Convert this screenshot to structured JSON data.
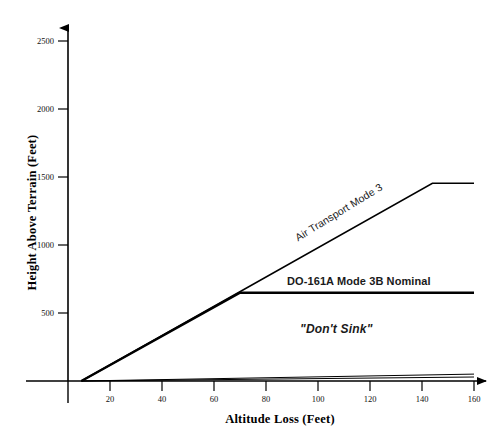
{
  "chart_data": {
    "type": "line",
    "title": "",
    "xlabel": "Altitude Loss (Feet)",
    "ylabel": "Height Above Terrain (Feet)",
    "xlim": [
      0,
      163
    ],
    "ylim": [
      0,
      2620
    ],
    "xticks": [
      20,
      40,
      60,
      80,
      100,
      120,
      140,
      160
    ],
    "yticks": [
      500,
      1000,
      1500,
      2000,
      2500
    ],
    "xtick_labels": [
      "20",
      "40",
      "60",
      "80",
      "100",
      "120",
      "140",
      "160"
    ],
    "ytick_labels": [
      "500",
      "1000",
      "1500",
      "2000",
      "2500"
    ],
    "grid": false,
    "legend": "inline-annotations",
    "series": [
      {
        "name": "Air Transport Mode 3",
        "style": "solid",
        "linewidth": 1.6,
        "color": "#000000",
        "points": [
          [
            9,
            0
          ],
          [
            144,
            1480
          ],
          [
            160,
            1480
          ]
        ]
      },
      {
        "name": "DO-161A Mode 3B Nominal",
        "style": "solid",
        "linewidth": 2.4,
        "color": "#000000",
        "points": [
          [
            9,
            0
          ],
          [
            70,
            660
          ],
          [
            160,
            660
          ]
        ]
      },
      {
        "name": "lower-envelope-upper",
        "style": "solid",
        "linewidth": 1.0,
        "color": "#000000",
        "points": [
          [
            9,
            0
          ],
          [
            160,
            52
          ]
        ]
      },
      {
        "name": "lower-envelope-lower",
        "style": "solid",
        "linewidth": 1.0,
        "color": "#000000",
        "points": [
          [
            9,
            0
          ],
          [
            160,
            30
          ]
        ]
      }
    ],
    "annotations": [
      {
        "name": "air-transport-mode-3",
        "text": "Air Transport Mode 3",
        "rotation": -31.5,
        "bold": false,
        "italic": false
      },
      {
        "name": "do-161a-mode-3b-nominal",
        "text": "DO-161A Mode 3B Nominal",
        "rotation": 0,
        "bold": true,
        "italic": false
      },
      {
        "name": "dont-sink",
        "text": "\"Don't Sink\"",
        "rotation": 0,
        "bold": true,
        "italic": true
      }
    ],
    "axis_style": {
      "x_arrow": true,
      "y_arrow": true,
      "spine_color": "#000000",
      "tick_direction": "out"
    }
  },
  "axes": {
    "x_title": "Altitude Loss (Feet)",
    "y_title": "Height Above Terrain (Feet)",
    "x_ticks": [
      {
        "value": 20,
        "label": "20"
      },
      {
        "value": 40,
        "label": "40"
      },
      {
        "value": 60,
        "label": "60"
      },
      {
        "value": 80,
        "label": "80"
      },
      {
        "value": 100,
        "label": "100"
      },
      {
        "value": 120,
        "label": "120"
      },
      {
        "value": 140,
        "label": "140"
      },
      {
        "value": 160,
        "label": "160"
      }
    ],
    "y_ticks": [
      {
        "value": 500,
        "label": "500"
      },
      {
        "value": 1000,
        "label": "1000"
      },
      {
        "value": 1500,
        "label": "1500"
      },
      {
        "value": 2000,
        "label": "2000"
      },
      {
        "value": 2500,
        "label": "2500"
      }
    ]
  },
  "labels": {
    "air_transport": "Air Transport Mode 3",
    "do_161a": "DO-161A Mode 3B Nominal",
    "dont_sink": "\"Don't Sink\""
  },
  "colors": {
    "background": "#ffffff",
    "ink": "#000000",
    "text": "#111111"
  }
}
